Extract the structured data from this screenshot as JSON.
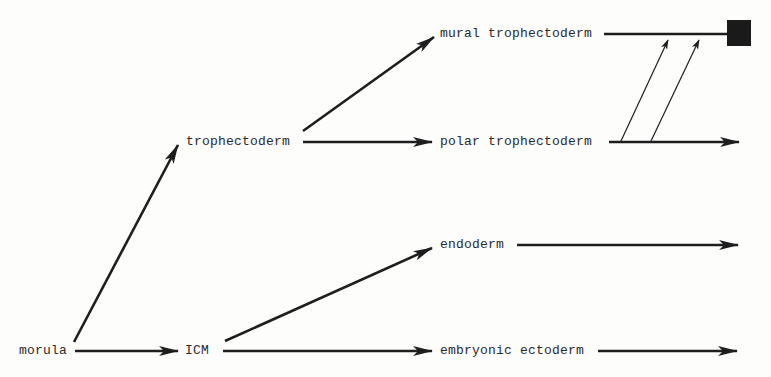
{
  "diagram": {
    "type": "cell-lineage-flowchart",
    "nodes": {
      "morula": "morula",
      "icm": "ICM",
      "trophectoderm": "trophectoderm",
      "mural_trophectoderm": "mural trophectoderm",
      "polar_trophectoderm": "polar trophectoderm",
      "endoderm": "endoderm",
      "embryonic_ectoderm": "embryonic ectoderm"
    },
    "edges": [
      {
        "from": "morula",
        "to": "trophectoderm"
      },
      {
        "from": "morula",
        "to": "ICM"
      },
      {
        "from": "trophectoderm",
        "to": "mural trophectoderm"
      },
      {
        "from": "trophectoderm",
        "to": "polar trophectoderm"
      },
      {
        "from": "ICM",
        "to": "endoderm"
      },
      {
        "from": "ICM",
        "to": "embryonic ectoderm"
      },
      {
        "from": "polar trophectoderm",
        "to": "mural trophectoderm",
        "style": "thin",
        "count": 2
      },
      {
        "from": "mural trophectoderm",
        "to": "terminal",
        "terminal": "filled-square"
      },
      {
        "from": "polar trophectoderm",
        "to": "continuation"
      },
      {
        "from": "endoderm",
        "to": "continuation"
      },
      {
        "from": "embryonic ectoderm",
        "to": "continuation"
      }
    ],
    "colors": {
      "line": "#1e1e1e",
      "text": "#2a2a2a",
      "terminal_block": "#1a1a1a",
      "background": "#fdfdfc"
    }
  }
}
